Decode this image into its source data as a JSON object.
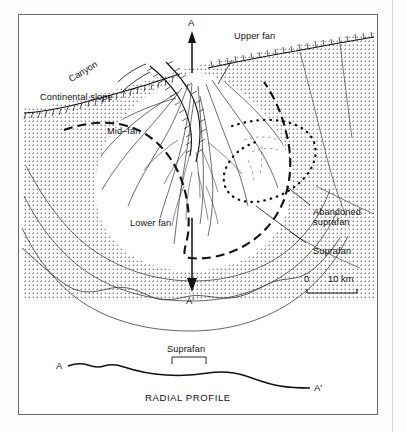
{
  "figure": {
    "kind": "submarine-fan-diagram",
    "map_view": {
      "labels": {
        "continental_slope": "Continental slope",
        "canyon": "Canyon",
        "upper_fan": "Upper fan",
        "mid_fan": "Mid–fan",
        "lower_fan": "Lower fan",
        "abandoned_suprafan_line1": "Abandoned",
        "abandoned_suprafan_line2": "suprafan",
        "suprafan": "Suprafan",
        "section_start": "A",
        "section_end": "A'"
      },
      "scale_bar": {
        "min_label": "0",
        "max_label": "10 km",
        "length_km": 10
      }
    },
    "profile_view": {
      "caption": "RADIAL PROFILE",
      "start_label": "A",
      "end_label": "A'",
      "bracket_label": "Suprafan"
    },
    "colors": {
      "ink": "#111111",
      "frame": "#6a6a6a",
      "stipple": "#555555",
      "paper": "#ffffff"
    }
  }
}
